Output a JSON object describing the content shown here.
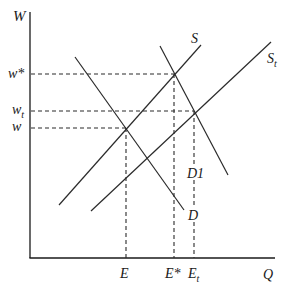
{
  "diagram": {
    "axes": {
      "y_label": "W",
      "x_label": "Q"
    },
    "y_ticks": [
      {
        "id": "w_star",
        "label": "w*",
        "sub": ""
      },
      {
        "id": "w_t",
        "label": "w",
        "sub": "t"
      },
      {
        "id": "w",
        "label": "w",
        "sub": ""
      }
    ],
    "x_ticks": [
      {
        "id": "E",
        "label": "E",
        "sub": ""
      },
      {
        "id": "E_star",
        "label": "E*",
        "sub": ""
      },
      {
        "id": "E_t",
        "label": "E",
        "sub": "t"
      }
    ],
    "curves": [
      {
        "id": "S",
        "label": "S",
        "sub": "",
        "type": "supply"
      },
      {
        "id": "S_t",
        "label": "S",
        "sub": "t",
        "type": "supply"
      },
      {
        "id": "D",
        "label": "D",
        "sub": "",
        "type": "demand"
      },
      {
        "id": "D1",
        "label": "D1",
        "sub": "",
        "type": "demand"
      }
    ],
    "equilibria": [
      {
        "curves": [
          "S",
          "D"
        ],
        "wage": "w",
        "quantity": "E"
      },
      {
        "curves": [
          "S",
          "D1"
        ],
        "wage": "w*",
        "quantity": "E*"
      },
      {
        "curves": [
          "S_t",
          "D1"
        ],
        "wage": "w_t",
        "quantity": "E_t"
      }
    ]
  }
}
